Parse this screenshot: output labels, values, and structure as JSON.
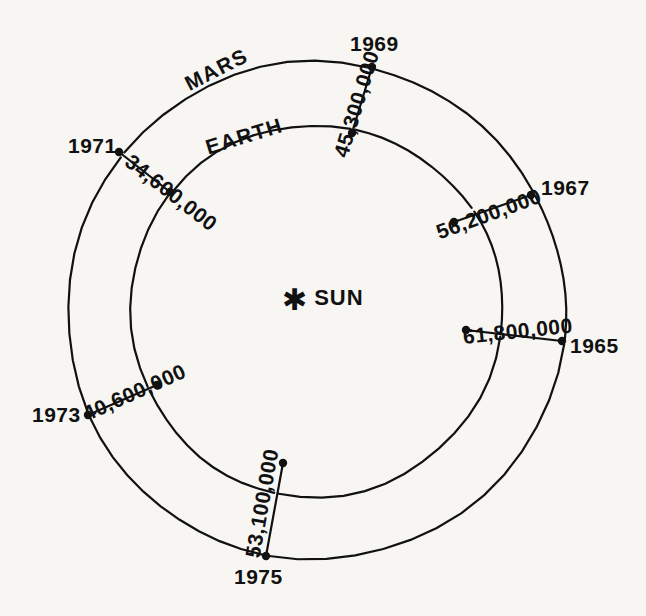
{
  "figure": {
    "center_label": "SUN",
    "center_icon": "sun-asterisk-icon",
    "orbits": [
      {
        "id": "mars",
        "name": "MARS",
        "radius_px": 249
      },
      {
        "id": "earth",
        "name": "EARTH",
        "radius_px": 186
      }
    ]
  },
  "chart_data": {
    "type": "scatter",
    "title": "",
    "subtitle": "",
    "xlabel": "",
    "ylabel": "",
    "legend": [
      "MARS",
      "EARTH"
    ],
    "annotations": [
      "SUN",
      "MARS",
      "EARTH"
    ],
    "center": {
      "x": 316,
      "y": 311,
      "label": "SUN"
    },
    "orbit_radii": {
      "mars": 249,
      "earth": 186
    },
    "series": [
      {
        "name": "Mars-Earth opposition distances (miles)",
        "points": [
          {
            "year": "1965",
            "distance": "61,800,000",
            "distance_value": 61800000,
            "mars_point": {
              "x": 562,
              "y": 341
            },
            "earth_point": {
              "x": 466,
              "y": 330
            },
            "year_label_pos": {
              "x": 570,
              "y": 335
            },
            "distance_label_pos": {
              "x": 463,
              "y": 326
            },
            "distance_label_rotation": -6
          },
          {
            "year": "1967",
            "distance": "56,200,000",
            "distance_value": 56200000,
            "mars_point": {
              "x": 531,
              "y": 195
            },
            "earth_point": {
              "x": 454,
              "y": 222
            },
            "year_label_pos": {
              "x": 541,
              "y": 177
            },
            "distance_label_pos": {
              "x": 437,
              "y": 222
            },
            "distance_label_rotation": -20
          },
          {
            "year": "1969",
            "distance": "45,300,000",
            "distance_value": 45300000,
            "mars_point": {
              "x": 372,
              "y": 67
            },
            "earth_point": {
              "x": 352,
              "y": 133
            },
            "year_label_pos": {
              "x": 350,
              "y": 33
            },
            "distance_label_pos": {
              "x": 340,
              "y": 146
            },
            "distance_label_rotation": -73
          },
          {
            "year": "1971",
            "distance": "34,600,000",
            "distance_value": 34600000,
            "mars_point": {
              "x": 119,
              "y": 152
            },
            "earth_point": {
              "x": 170,
              "y": 192
            },
            "year_label_pos": {
              "x": 68,
              "y": 135
            },
            "distance_label_pos": {
              "x": 128,
              "y": 148
            },
            "distance_label_rotation": 38
          },
          {
            "year": "1973",
            "distance": "40,600,000",
            "distance_value": 40600000,
            "mars_point": {
              "x": 88,
              "y": 415
            },
            "earth_point": {
              "x": 157,
              "y": 385
            },
            "year_label_pos": {
              "x": 32,
              "y": 404
            },
            "distance_label_pos": {
              "x": 84,
              "y": 404
            },
            "distance_label_rotation": -24
          },
          {
            "year": "1975",
            "distance": "53,100,000",
            "distance_value": 53100000,
            "mars_point": {
              "x": 266,
              "y": 556
            },
            "earth_point": {
              "x": 283,
              "y": 463
            },
            "year_label_pos": {
              "x": 234,
              "y": 566
            },
            "distance_label_pos": {
              "x": 252,
              "y": 547
            },
            "distance_label_rotation": -80
          }
        ]
      }
    ],
    "orbit_name_labels": [
      {
        "text": "MARS",
        "x": 186,
        "y": 74,
        "rotation": -27
      },
      {
        "text": "EARTH",
        "x": 206,
        "y": 137,
        "rotation": -17
      }
    ]
  }
}
